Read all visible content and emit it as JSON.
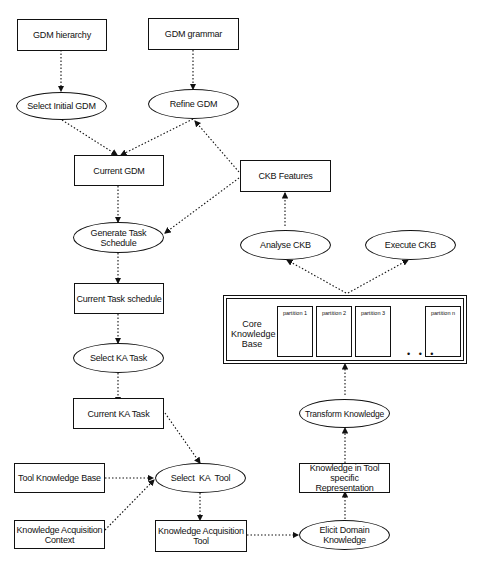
{
  "diagram": {
    "nodes": {
      "gdm_hierarchy": "GDM hierarchy",
      "gdm_grammar": "GDM grammar",
      "select_initial_gdm": "Select Initial GDM",
      "refine_gdm": "Refine GDM",
      "current_gdm": "Current GDM",
      "ckb_features": "CKB Features",
      "generate_task_schedule": "Generate Task Schedule",
      "analyse_ckb": "Analyse CKB",
      "execute_ckb": "Execute CKB",
      "current_task_schedule": "Current Task schedule",
      "select_ka_task": "Select KA Task",
      "current_ka_task": "Current KA Task",
      "transform_knowledge": "Transform Knowledge",
      "tool_knowledge_base": "Tool Knowledge Base",
      "select_ka_tool": "Select  KA  Tool",
      "knowledge_in_tool": "Knowledge in Tool specific Representation",
      "ka_context": "Knowledge Acquisition Context",
      "ka_tool": "Knowledge Acquisition Tool",
      "elicit_domain_knowledge": "Elicit Domain Knowledge"
    },
    "core_kb": {
      "label": "Core Knowledge Base",
      "partitions": [
        "partition 1",
        "partition 2",
        "partition 3",
        "partition n"
      ],
      "ellipsis": "• • •"
    },
    "edges": [
      [
        "GDM hierarchy",
        "Select Initial GDM"
      ],
      [
        "GDM grammar",
        "Refine GDM"
      ],
      [
        "Select Initial GDM",
        "Current GDM"
      ],
      [
        "Refine GDM",
        "Current GDM"
      ],
      [
        "CKB Features",
        "Refine GDM"
      ],
      [
        "CKB Features",
        "Generate Task Schedule"
      ],
      [
        "Current GDM",
        "Generate Task Schedule"
      ],
      [
        "Analyse CKB",
        "CKB Features"
      ],
      [
        "Core Knowledge Base",
        "Analyse CKB"
      ],
      [
        "Core Knowledge Base",
        "Execute CKB"
      ],
      [
        "Generate Task Schedule",
        "Current Task schedule"
      ],
      [
        "Current Task schedule",
        "Select KA Task"
      ],
      [
        "Select KA Task",
        "Current KA Task"
      ],
      [
        "Current KA Task",
        "Select KA Tool"
      ],
      [
        "Tool Knowledge Base",
        "Select KA Tool"
      ],
      [
        "Knowledge Acquisition Context",
        "Select KA Tool"
      ],
      [
        "Select KA Tool",
        "Knowledge Acquisition Tool"
      ],
      [
        "Knowledge Acquisition Tool",
        "Elicit Domain Knowledge"
      ],
      [
        "Elicit Domain Knowledge",
        "Knowledge in Tool specific Representation"
      ],
      [
        "Knowledge in Tool specific Representation",
        "Transform Knowledge"
      ],
      [
        "Transform Knowledge",
        "Core Knowledge Base"
      ]
    ]
  }
}
